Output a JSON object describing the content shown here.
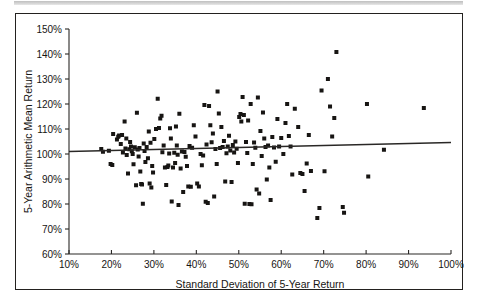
{
  "figure": {
    "top_rule_label": "top-rule",
    "frame_color": "#23211f",
    "background": "#ffffff"
  },
  "chart_data": {
    "type": "scatter",
    "title": "",
    "xlabel": "Standard Deviation of 5-Year Return",
    "ylabel": "5-Year Arithmetic Mean Return",
    "xlim": [
      10,
      100
    ],
    "ylim": [
      60,
      150
    ],
    "grid": false,
    "legend": "none",
    "marker": "filled-square",
    "marker_color": "#171513",
    "x_ticks": [
      10,
      20,
      30,
      40,
      50,
      60,
      70,
      80,
      90,
      100
    ],
    "y_ticks": [
      60,
      70,
      80,
      90,
      100,
      110,
      120,
      130,
      140,
      150
    ],
    "x_tick_labels": [
      "10%",
      "20%",
      "30%",
      "40%",
      "50%",
      "60%",
      "70%",
      "80%",
      "90%",
      "100%"
    ],
    "y_tick_labels": [
      "60%",
      "70%",
      "80%",
      "90%",
      "100%",
      "110%",
      "120%",
      "130%",
      "140%",
      "150%"
    ],
    "trend_line": {
      "x": [
        10,
        100
      ],
      "y": [
        101.0,
        104.6
      ],
      "color": "#2a2826"
    },
    "points": [
      [
        17.6,
        102.0
      ],
      [
        18.0,
        100.9
      ],
      [
        19.4,
        101.3
      ],
      [
        19.8,
        96.0
      ],
      [
        20.2,
        95.6
      ],
      [
        20.4,
        108.0
      ],
      [
        21.3,
        105.8
      ],
      [
        21.6,
        106.9
      ],
      [
        21.8,
        107.4
      ],
      [
        22.2,
        104.0
      ],
      [
        22.5,
        107.6
      ],
      [
        22.7,
        100.6
      ],
      [
        23.1,
        113.0
      ],
      [
        23.3,
        102.2
      ],
      [
        23.5,
        106.2
      ],
      [
        23.6,
        99.6
      ],
      [
        23.9,
        92.2
      ],
      [
        24.2,
        101.9
      ],
      [
        24.4,
        104.8
      ],
      [
        24.6,
        103.0
      ],
      [
        24.8,
        101.1
      ],
      [
        25.0,
        100.0
      ],
      [
        25.2,
        95.9
      ],
      [
        25.5,
        102.7
      ],
      [
        25.8,
        87.5
      ],
      [
        26.0,
        116.5
      ],
      [
        26.2,
        101.8
      ],
      [
        26.4,
        99.0
      ],
      [
        26.6,
        102.4
      ],
      [
        26.8,
        93.0
      ],
      [
        27.0,
        88.0
      ],
      [
        27.2,
        87.8
      ],
      [
        27.4,
        80.1
      ],
      [
        27.6,
        104.2
      ],
      [
        27.8,
        101.2
      ],
      [
        28.0,
        96.8
      ],
      [
        28.3,
        102.8
      ],
      [
        28.6,
        98.3
      ],
      [
        28.8,
        109.0
      ],
      [
        29.0,
        88.2
      ],
      [
        29.2,
        104.5
      ],
      [
        29.4,
        86.6
      ],
      [
        29.6,
        95.2
      ],
      [
        29.8,
        92.6
      ],
      [
        30.1,
        106.0
      ],
      [
        30.5,
        110.0
      ],
      [
        30.9,
        122.1
      ],
      [
        31.2,
        110.4
      ],
      [
        31.5,
        114.2
      ],
      [
        31.8,
        115.3
      ],
      [
        32.0,
        100.7
      ],
      [
        32.3,
        103.4
      ],
      [
        32.6,
        94.6
      ],
      [
        32.9,
        87.6
      ],
      [
        33.2,
        94.8
      ],
      [
        33.4,
        95.4
      ],
      [
        33.6,
        100.2
      ],
      [
        33.8,
        110.3
      ],
      [
        34.0,
        106.2
      ],
      [
        34.2,
        81.0
      ],
      [
        34.5,
        94.6
      ],
      [
        34.8,
        100.5
      ],
      [
        35.0,
        96.4
      ],
      [
        35.2,
        111.0
      ],
      [
        35.4,
        103.4
      ],
      [
        35.6,
        99.7
      ],
      [
        35.8,
        79.6
      ],
      [
        36.0,
        116.1
      ],
      [
        36.3,
        94.2
      ],
      [
        36.6,
        101.0
      ],
      [
        36.9,
        84.8
      ],
      [
        37.2,
        100.8
      ],
      [
        37.5,
        98.9
      ],
      [
        37.8,
        95.2
      ],
      [
        38.1,
        87.0
      ],
      [
        38.4,
        103.2
      ],
      [
        38.7,
        86.9
      ],
      [
        39.0,
        102.5
      ],
      [
        39.4,
        111.5
      ],
      [
        39.8,
        107.0
      ],
      [
        40.2,
        88.2
      ],
      [
        40.6,
        87.0
      ],
      [
        41.0,
        100.0
      ],
      [
        41.3,
        95.5
      ],
      [
        41.6,
        99.4
      ],
      [
        41.9,
        119.6
      ],
      [
        42.2,
        80.9
      ],
      [
        42.4,
        103.8
      ],
      [
        42.7,
        80.4
      ],
      [
        43.0,
        119.2
      ],
      [
        43.3,
        111.5
      ],
      [
        43.6,
        104.7
      ],
      [
        43.9,
        108.2
      ],
      [
        44.2,
        83.0
      ],
      [
        44.5,
        102.0
      ],
      [
        44.8,
        96.0
      ],
      [
        45.0,
        125.0
      ],
      [
        45.3,
        116.2
      ],
      [
        45.6,
        102.4
      ],
      [
        45.9,
        110.8
      ],
      [
        46.2,
        102.8
      ],
      [
        46.5,
        105.2
      ],
      [
        46.8,
        89.0
      ],
      [
        47.1,
        100.3
      ],
      [
        47.4,
        103.0
      ],
      [
        47.7,
        107.3
      ],
      [
        48.0,
        101.4
      ],
      [
        48.3,
        88.8
      ],
      [
        48.6,
        103.6
      ],
      [
        48.9,
        100.6
      ],
      [
        49.2,
        105.0
      ],
      [
        49.5,
        102.1
      ],
      [
        49.8,
        96.4
      ],
      [
        50.1,
        114.8
      ],
      [
        50.4,
        116.0
      ],
      [
        50.6,
        113.0
      ],
      [
        50.9,
        122.8
      ],
      [
        51.2,
        115.6
      ],
      [
        51.4,
        80.1
      ],
      [
        51.7,
        104.8
      ],
      [
        52.0,
        100.4
      ],
      [
        52.2,
        113.4
      ],
      [
        52.5,
        80.0
      ],
      [
        52.8,
        120.0
      ],
      [
        53.0,
        79.9
      ],
      [
        53.3,
        96.0
      ],
      [
        53.6,
        104.6
      ],
      [
        53.9,
        102.5
      ],
      [
        54.2,
        85.8
      ],
      [
        54.5,
        122.6
      ],
      [
        54.8,
        84.2
      ],
      [
        55.1,
        109.2
      ],
      [
        55.4,
        99.2
      ],
      [
        55.7,
        116.6
      ],
      [
        56.0,
        106.2
      ],
      [
        56.3,
        102.8
      ],
      [
        56.6,
        89.8
      ],
      [
        56.9,
        103.4
      ],
      [
        57.2,
        94.6
      ],
      [
        57.5,
        81.6
      ],
      [
        57.9,
        106.8
      ],
      [
        58.3,
        102.6
      ],
      [
        58.7,
        96.9
      ],
      [
        59.1,
        114.0
      ],
      [
        59.5,
        103.0
      ],
      [
        60.0,
        106.4
      ],
      [
        60.5,
        100.0
      ],
      [
        61.0,
        112.4
      ],
      [
        61.4,
        120.0
      ],
      [
        61.8,
        107.2
      ],
      [
        62.2,
        103.0
      ],
      [
        62.6,
        91.8
      ],
      [
        63.2,
        118.1
      ],
      [
        64.0,
        110.8
      ],
      [
        64.5,
        92.4
      ],
      [
        65.0,
        92.0
      ],
      [
        65.5,
        85.2
      ],
      [
        66.0,
        96.2
      ],
      [
        66.5,
        107.6
      ],
      [
        67.0,
        93.2
      ],
      [
        68.5,
        74.4
      ],
      [
        69.0,
        78.4
      ],
      [
        69.5,
        125.4
      ],
      [
        70.2,
        93.1
      ],
      [
        71.0,
        130.0
      ],
      [
        71.5,
        119.0
      ],
      [
        72.0,
        107.0
      ],
      [
        72.5,
        114.4
      ],
      [
        73.0,
        140.8
      ],
      [
        74.5,
        78.8
      ],
      [
        74.8,
        76.5
      ],
      [
        80.2,
        120.0
      ],
      [
        80.5,
        91.0
      ],
      [
        84.2,
        101.7
      ],
      [
        93.6,
        118.4
      ]
    ]
  }
}
